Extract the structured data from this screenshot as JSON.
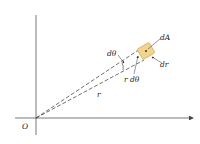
{
  "diagram": {
    "labels": {
      "origin": "O",
      "d_theta": "dθ",
      "d_area": "dA",
      "d_r": "dr",
      "r_d_theta": "r dθ",
      "radius": "r"
    },
    "colors": {
      "axis": "#444444",
      "dashed": "#333333",
      "element_fill": "#f1d48f",
      "element_stroke": "#c9a24a"
    }
  }
}
